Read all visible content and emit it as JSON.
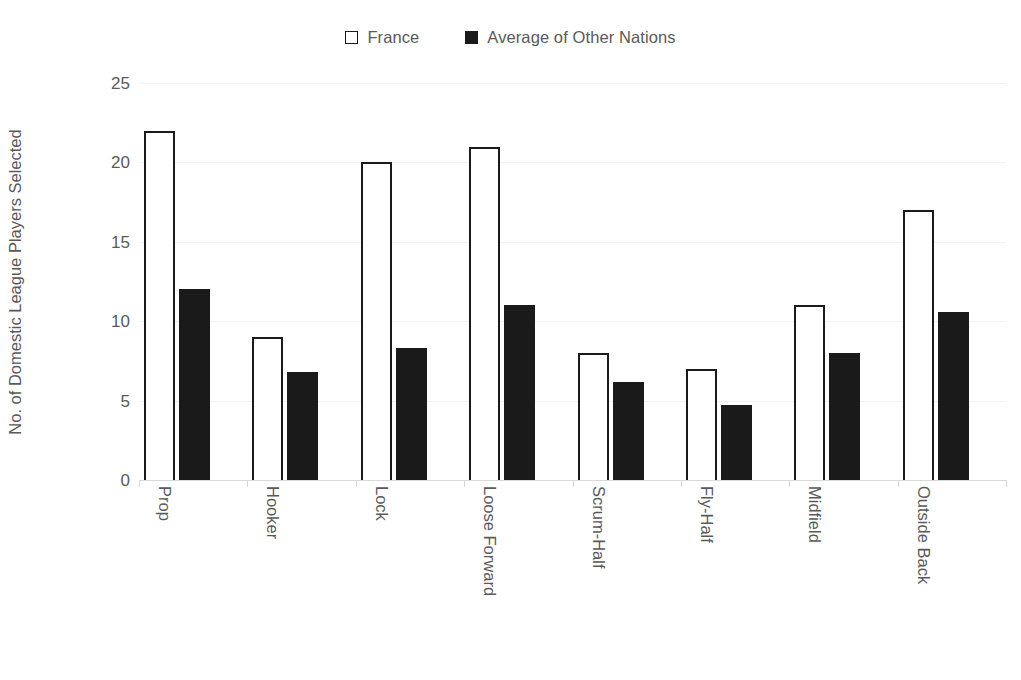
{
  "chart_data": {
    "type": "bar",
    "title": "",
    "subtitle": "",
    "xlabel": "",
    "ylabel": "No. of Domestic League Players Selected",
    "ylim": [
      0,
      25
    ],
    "yticks": [
      0,
      5,
      10,
      15,
      20,
      25
    ],
    "ytick_labels": [
      "0",
      "5",
      "10",
      "15",
      "20",
      "25"
    ],
    "grid": true,
    "grid_axis": "y",
    "legend_position": "top-center",
    "categories": [
      "Prop",
      "Hooker",
      "Lock",
      "Loose Forward",
      "Scrum-Half",
      "Fly-Half",
      "Midfield",
      "Outside Back"
    ],
    "series": [
      {
        "name": "France",
        "color": "#ffffff",
        "edge_color": "#1a1a1a",
        "values": [
          22,
          9,
          20,
          21,
          8,
          7,
          11,
          17
        ]
      },
      {
        "name": "Average of Other Nations",
        "color": "#1a1a1a",
        "edge_color": "#1a1a1a",
        "values": [
          12,
          6.8,
          8.3,
          11,
          6.2,
          4.7,
          8,
          10.6
        ]
      }
    ]
  },
  "legend": {
    "items": [
      {
        "label": "France",
        "style": "outline"
      },
      {
        "label": "Average of Other Nations",
        "style": "filled"
      }
    ]
  },
  "colors": {
    "background": "#ffffff",
    "text": "#5a5a5a",
    "bar_outline": "#1a1a1a",
    "bar_fill": "#1a1a1a",
    "gridline": "#f2f2f2",
    "axis": "#d9d9d9"
  }
}
